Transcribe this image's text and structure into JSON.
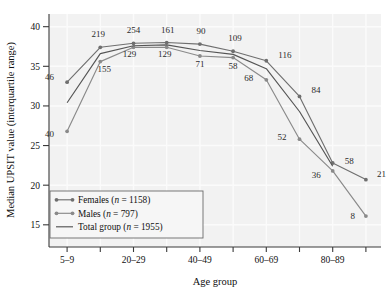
{
  "chart_data": {
    "type": "line",
    "title": "",
    "xlabel": "Age group",
    "ylabel": "Median UPSIT value (interquartile range)",
    "ylim": [
      12.2,
      41.6
    ],
    "yticks": [
      15,
      20,
      25,
      30,
      35,
      40
    ],
    "ytick_labels": [
      "15",
      "20",
      "25",
      "30",
      "35",
      "40"
    ],
    "grid": true,
    "legend_position": "lower-left",
    "categories": [
      "5–9",
      "10–19",
      "20–29",
      "30–39",
      "40–49",
      "50–59",
      "60–69",
      "70–79",
      "80–89",
      "90+"
    ],
    "xtick_labels": [
      "5–9",
      "",
      "20–29",
      "",
      "40–49",
      "",
      "60–69",
      "",
      "80–89",
      ""
    ],
    "series": [
      {
        "name": "Females",
        "n": 1158,
        "legend_label": "Females (n = 1158)",
        "color": "#6f6f6f",
        "values": [
          33.0,
          37.4,
          37.9,
          38.0,
          37.8,
          36.9,
          35.7,
          31.2,
          22.8,
          20.7
        ],
        "point_labels": [
          "46",
          "219",
          "254",
          "161",
          "90",
          "109",
          "116",
          "84",
          "58",
          "21"
        ]
      },
      {
        "name": "Males",
        "n": 797,
        "legend_label": "Males (n = 797)",
        "color": "#8a8a8a",
        "values": [
          26.8,
          35.6,
          37.4,
          37.4,
          36.3,
          36.1,
          33.3,
          25.8,
          21.8,
          16.1
        ],
        "point_labels": [
          "40",
          "155",
          "129",
          "129",
          "71",
          "58",
          "68",
          "52",
          "36",
          "8"
        ]
      },
      {
        "name": "Total group",
        "n": 1955,
        "legend_label": "Total group (n = 1955)",
        "color": "#555555",
        "values": [
          30.4,
          36.6,
          37.6,
          37.7,
          37.0,
          36.5,
          34.7,
          29.3,
          22.4,
          null
        ],
        "point_labels": [
          "",
          "",
          "",
          "",
          "",
          "",
          "",
          "",
          "",
          ""
        ]
      }
    ],
    "label_offsets": {
      "Females": [
        [
          -13,
          -2
        ],
        [
          -2,
          -10
        ],
        [
          0,
          -10
        ],
        [
          1,
          -10
        ],
        [
          1,
          -10
        ],
        [
          2,
          -10
        ],
        [
          12,
          -3
        ],
        [
          12,
          -3
        ],
        [
          12,
          1
        ],
        [
          11,
          -3
        ]
      ],
      "Males": [
        [
          -13,
          6
        ],
        [
          4,
          10
        ],
        [
          -4,
          10
        ],
        [
          -2,
          10
        ],
        [
          0,
          11
        ],
        [
          0,
          11
        ],
        [
          -13,
          1
        ],
        [
          -13,
          1
        ],
        [
          -12,
          7
        ],
        [
          -11,
          3
        ]
      ]
    }
  },
  "axes": {
    "x_axis_label": "Age group",
    "y_axis_label": "Median UPSIT value (interquartile range)"
  },
  "legend": {
    "entries": [
      {
        "label_main": "Females (",
        "n_italic": "n",
        "n_rest": " = 1158)",
        "marker": "line-with-dots"
      },
      {
        "label_main": "Males (",
        "n_italic": "n",
        "n_rest": " = 797)",
        "marker": "line-with-dots"
      },
      {
        "label_main": "Total group (",
        "n_italic": "n",
        "n_rest": " = 1955)",
        "marker": "plain-line"
      }
    ]
  },
  "colors": {
    "plot_background": "#f2f2f2",
    "gridline": "#fbfbfb",
    "axis": "#3a3a3a",
    "females": "#6f6f6f",
    "males": "#8a8a8a",
    "total": "#555555"
  }
}
